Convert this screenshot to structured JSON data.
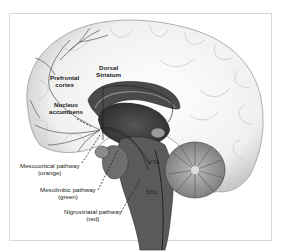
{
  "diagram": {
    "type": "sagittal brain section",
    "labels": {
      "prefrontal_cortex": [
        "Prefrontal",
        "cortex"
      ],
      "dorsal_striatum": [
        "Dorsal",
        "Striatum"
      ],
      "nucleus_accumbens": [
        "Nucleus",
        "accumbens"
      ],
      "vta": "VTA",
      "snc": "SNc",
      "mesocortical": [
        "Mesocortical pathway",
        "(orange)"
      ],
      "mesolimbic": [
        "Mesolimbic pathway",
        "(green)"
      ],
      "nigrostriatal": [
        "Nigrostriatal pathway",
        "(red)"
      ]
    },
    "colors": {
      "frame_border": "#d8d8d8",
      "cortex_fill": "#f4f4f4",
      "cortex_stroke": "#9a9a9a",
      "inner_dark": "#3a3a3a",
      "mid_gray": "#6e6e6e",
      "pathway_line": "#333333"
    }
  }
}
